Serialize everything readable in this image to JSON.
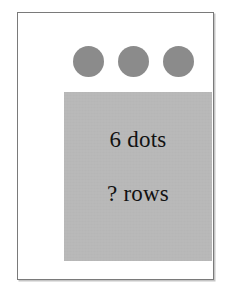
{
  "figure": {
    "title": "6 dots ? rows",
    "background_color": "#ffffff",
    "frame": {
      "name": "outer-frame",
      "border_color": "#7a7a7a",
      "fill_color": "#ffffff"
    },
    "dots": {
      "count": 3,
      "color": "#8b8b8b",
      "shape": "circle",
      "diameter_px": 31,
      "items": [
        {
          "index": 1,
          "label": "dot"
        },
        {
          "index": 2,
          "label": "dot"
        },
        {
          "index": 3,
          "label": "dot"
        }
      ]
    },
    "panel": {
      "name": "grey-panel",
      "color": "#b9b9b9",
      "lines": [
        {
          "id": "dots-line",
          "text": "6 dots"
        },
        {
          "id": "rows-line",
          "text": "? rows"
        }
      ]
    }
  }
}
